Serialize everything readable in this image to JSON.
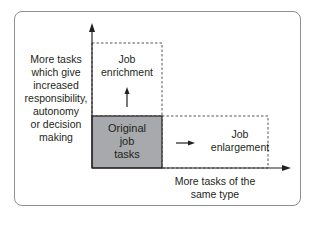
{
  "diagram": {
    "y_axis_label": [
      "More tasks",
      "which give",
      "increased",
      "responsibility,",
      "autonomy",
      "or decision",
      "making"
    ],
    "x_axis_label": [
      "More tasks of the",
      "same type"
    ],
    "boxes": {
      "original": {
        "label": [
          "Original",
          "job",
          "tasks"
        ],
        "fill": "#a7a9ac"
      },
      "enrichment": {
        "label": [
          "Job",
          "enrichment"
        ],
        "style": "dashed"
      },
      "enlargement": {
        "label": [
          "Job",
          "enlargement"
        ],
        "style": "dashed"
      }
    },
    "colors": {
      "frame": "#8f8f8f",
      "axis": "#231f20",
      "original_fill": "#a7a9ac",
      "dashed": "#555555"
    }
  }
}
